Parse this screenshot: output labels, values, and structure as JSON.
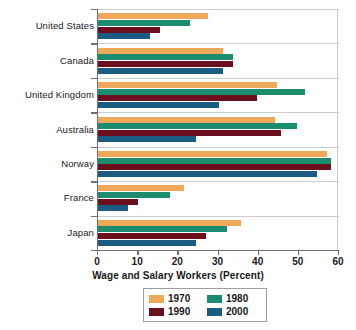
{
  "chart_data": {
    "type": "bar",
    "orientation": "horizontal",
    "title": "",
    "xlabel": "Wage and Salary Workers (Percent)",
    "ylabel": "",
    "xlim": [
      0,
      60
    ],
    "xticks": [
      0,
      10,
      20,
      30,
      40,
      50,
      60
    ],
    "grid": true,
    "legend_position": "bottom",
    "categories": [
      "United States",
      "Canada",
      "United Kingdom",
      "Australia",
      "Norway",
      "France",
      "Japan"
    ],
    "series": [
      {
        "name": "1970",
        "color": "#EDA85A",
        "values": [
          27.5,
          31.0,
          44.5,
          44.0,
          57.0,
          21.5,
          35.5
        ]
      },
      {
        "name": "1980",
        "color": "#1B8C6E",
        "values": [
          23.0,
          33.5,
          51.5,
          49.5,
          58.0,
          18.0,
          32.0
        ]
      },
      {
        "name": "1990",
        "color": "#6B0E1E",
        "values": [
          15.5,
          33.5,
          39.5,
          45.5,
          58.0,
          10.0,
          27.0
        ]
      },
      {
        "name": "2000",
        "color": "#1A5C82",
        "values": [
          13.0,
          31.0,
          30.0,
          24.5,
          54.5,
          7.5,
          24.5
        ]
      }
    ]
  },
  "legend": {
    "entries": [
      {
        "label": "1970",
        "color": "#EDA85A"
      },
      {
        "label": "1980",
        "color": "#1B8C6E"
      },
      {
        "label": "1990",
        "color": "#6B0E1E"
      },
      {
        "label": "2000",
        "color": "#1A5C82"
      }
    ]
  },
  "colors": {
    "axis": "#6d6f72",
    "grid": "#c9ccd0",
    "text": "#17181a",
    "background": "#ffffff"
  }
}
